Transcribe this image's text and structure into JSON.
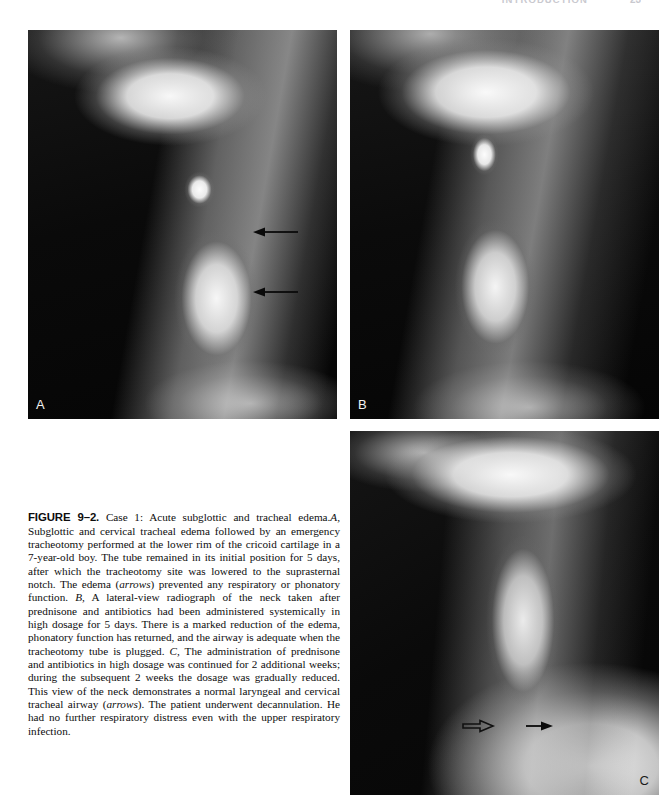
{
  "page": {
    "background_color": "#ffffff",
    "width": 659,
    "height": 802
  },
  "running_header": {
    "title": "INTRODUCTION",
    "page_number": "23",
    "color": "#c9c9cf",
    "note": "cropped at top edge of screenshot"
  },
  "figure": {
    "id": "figure-9-2",
    "panels": [
      {
        "letter": "A",
        "name": "panel-a",
        "modality": "lateral neck radiograph",
        "description": "Subglottic and cervical tracheal edema with tracheotomy tube in initial high position",
        "arrows": [
          {
            "name": "edema-arrow-upper",
            "style": "solid",
            "direction": "left"
          },
          {
            "name": "edema-arrow-lower",
            "style": "solid",
            "direction": "left"
          }
        ]
      },
      {
        "letter": "B",
        "name": "panel-b",
        "modality": "lateral neck radiograph",
        "description": "Marked reduction of edema after systemic prednisone and antibiotics",
        "arrows": []
      },
      {
        "letter": "C",
        "name": "panel-c",
        "modality": "lateral neck radiograph",
        "description": "Normal laryngeal and cervical tracheal airway after decannulation",
        "arrows": [
          {
            "name": "airway-arrow-open",
            "style": "open",
            "direction": "right"
          },
          {
            "name": "airway-arrow-solid",
            "style": "solid",
            "direction": "right"
          }
        ]
      }
    ]
  },
  "caption": {
    "label": "FIGURE 9–2.",
    "title": " Case 1: Acute subglottic and tracheal edema.",
    "segments": [
      {
        "style": "italic",
        "text": "A,"
      },
      {
        "style": "normal",
        "text": " Subglottic and cervical tracheal edema followed by an emergency tracheotomy performed at the lower rim of the cricoid cartilage in a 7-year-old boy. The tube remained in its initial position for 5 days, after which the tracheotomy site was lowered to the suprasternal notch. The edema ("
      },
      {
        "style": "italic",
        "text": "arrows"
      },
      {
        "style": "normal",
        "text": ") prevented any respiratory or phonatory function. "
      },
      {
        "style": "italic",
        "text": "B,"
      },
      {
        "style": "normal",
        "text": " A lateral-view radiograph of the neck taken after prednisone and antibiotics had been administered systemically in high dosage for 5 days. There is a marked reduction of the edema, phonatory function has returned, and the airway is adequate when the tracheotomy tube is plugged. "
      },
      {
        "style": "italic",
        "text": "C,"
      },
      {
        "style": "normal",
        "text": " The administration of prednisone and antibiotics in high dosage was continued for 2 additional weeks; during the subsequent 2 weeks the dosage was gradually reduced. This view of the neck demonstrates a normal laryngeal and cervical tracheal airway ("
      },
      {
        "style": "italic",
        "text": "arrows"
      },
      {
        "style": "normal",
        "text": "). The patient underwent decannulation. He had no further respiratory distress even with the upper respiratory infection."
      }
    ]
  }
}
